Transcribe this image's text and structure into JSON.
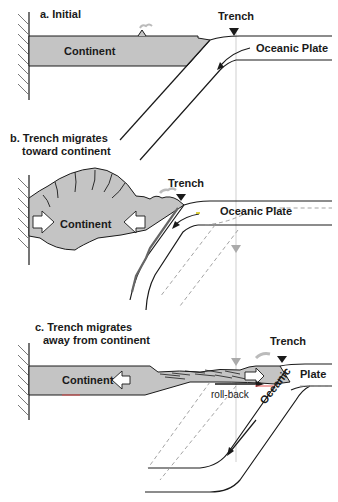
{
  "panels": {
    "a": {
      "title": "a. Initial",
      "continent_label": "Continent",
      "trench_label": "Trench",
      "plate_label": "Oceanic Plate"
    },
    "b": {
      "title_line1": "b. Trench migrates",
      "title_line2": "toward continent",
      "continent_label": "Continent",
      "trench_label": "Trench",
      "plate_label": "Oceanic Plate"
    },
    "c": {
      "title_line1": "c. Trench migrates",
      "title_line2": "away from continent",
      "continent_label": "Continent",
      "trench_label": "Trench",
      "plate_label": "Oceanic Plate",
      "rollback_label": "roll-back"
    }
  },
  "colors": {
    "continent_fill": "#c4c4c4",
    "line": "#1a1a1a",
    "reference_line": "#c8c8c8",
    "dashed": "#9a9a9a"
  }
}
